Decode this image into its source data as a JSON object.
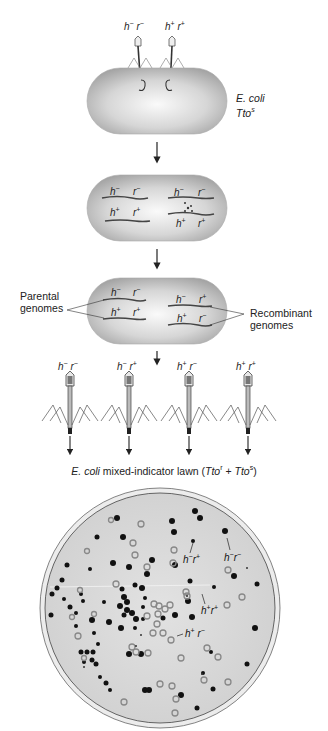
{
  "step1": {
    "phage_labels": [
      {
        "h": "h",
        "h_sign": "−",
        "r": "r",
        "r_sign": "−"
      },
      {
        "h": "h",
        "h_sign": "+",
        "r": "r",
        "r_sign": "+"
      }
    ],
    "host_label_line1": "E. coli",
    "host_label_line2": "Tto",
    "host_label_sup": "s"
  },
  "step2": {
    "left_genomes": [
      {
        "h": "h",
        "h_sign": "−",
        "r": "r",
        "r_sign": "−"
      },
      {
        "h": "h",
        "h_sign": "+",
        "r": "r",
        "r_sign": "+"
      }
    ],
    "right_genomes": [
      {
        "h": "h",
        "h_sign": "−",
        "r": "r",
        "r_sign": "−"
      },
      {
        "h": "h",
        "h_sign": "+",
        "r": "r",
        "r_sign": "+"
      }
    ]
  },
  "step3": {
    "parental_label_line1": "Parental",
    "parental_label_line2": "genomes",
    "recombinant_label_line1": "Recombinant",
    "recombinant_label_line2": "genomes",
    "left_genomes": [
      {
        "h": "h",
        "h_sign": "−",
        "r": "r",
        "r_sign": "−"
      },
      {
        "h": "h",
        "h_sign": "+",
        "r": "r",
        "r_sign": "+"
      }
    ],
    "right_genomes": [
      {
        "h": "h",
        "h_sign": "−",
        "r": "r",
        "r_sign": "+"
      },
      {
        "h": "h",
        "h_sign": "+",
        "r": "r",
        "r_sign": "−"
      }
    ]
  },
  "progeny": {
    "phages": [
      {
        "h": "h",
        "h_sign": "−",
        "r": "r",
        "r_sign": "−"
      },
      {
        "h": "h",
        "h_sign": "−",
        "r": "r",
        "r_sign": "+"
      },
      {
        "h": "h",
        "h_sign": "+",
        "r": "r",
        "r_sign": "−"
      },
      {
        "h": "h",
        "h_sign": "+",
        "r": "r",
        "r_sign": "+"
      }
    ],
    "lawn_host": "E. coli",
    "lawn_text": " mixed-indicator lawn (",
    "lawn_tto1": "Tto",
    "lawn_sup1": "r",
    "lawn_plus": " + ",
    "lawn_tto2": "Tto",
    "lawn_sup2": "s",
    "lawn_close": ")"
  },
  "plate": {
    "labels": [
      {
        "h": "h",
        "h_sign": "−",
        "r": "r",
        "r_sign": "+"
      },
      {
        "h": "h",
        "h_sign": "−",
        "r": "r",
        "r_sign": "−"
      },
      {
        "h": "h",
        "h_sign": "+",
        "r": "r",
        "r_sign": "+"
      },
      {
        "h": "h",
        "h_sign": "+",
        "r": "r",
        "r_sign": "−"
      }
    ]
  },
  "colors": {
    "cell_fill": "#c9c9c9",
    "cell_highlight": "#f4f4f4",
    "plaque_dark": "#111111",
    "plaque_ring": "#8a8a8a",
    "plate_bg": "#d9d9d9",
    "line": "#333333"
  }
}
